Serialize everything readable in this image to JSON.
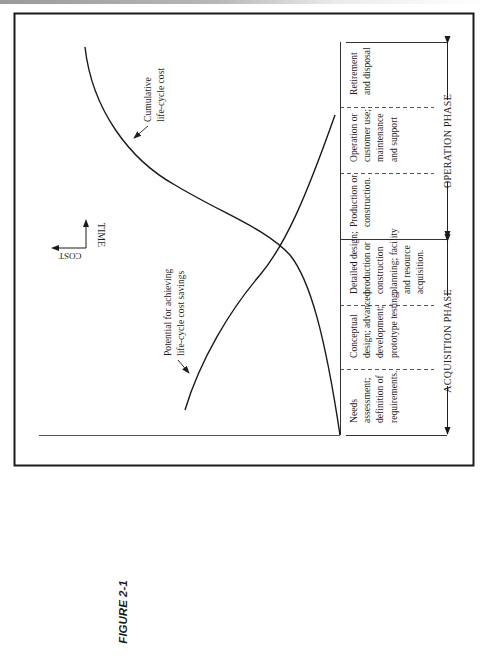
{
  "figure_label": "FIGURE 2-1",
  "axis_indicator": {
    "vertical": "TIME",
    "horizontal": "COST"
  },
  "curves": [
    {
      "id": "cumulative",
      "label_lines": [
        "Cumulative",
        "life-cycle cost"
      ]
    },
    {
      "id": "potential",
      "label_lines": [
        "Potential for achieving",
        "life-cycle cost savings"
      ]
    }
  ],
  "stages": [
    {
      "lines": [
        "Needs",
        "assessment;",
        "definition of",
        "requirements."
      ]
    },
    {
      "lines": [
        "Conceptual",
        "design; advanced",
        "development;",
        "prototype testing."
      ]
    },
    {
      "lines": [
        "Detailed design;",
        "production or",
        "construction",
        "planning; facility",
        "and resource",
        "acquisition."
      ]
    },
    {
      "lines": [
        "Production or",
        "construction."
      ]
    },
    {
      "lines": [
        "Operation or",
        "customer use;",
        "maintenance",
        "and support"
      ]
    },
    {
      "lines": [
        "Retirement",
        "and disposal"
      ]
    }
  ],
  "phases": [
    {
      "label": "ACQUISITION  PHASE",
      "stages": [
        0,
        1,
        2
      ]
    },
    {
      "label": "OPERATION  PHASE",
      "stages": [
        3,
        4,
        5
      ]
    }
  ]
}
